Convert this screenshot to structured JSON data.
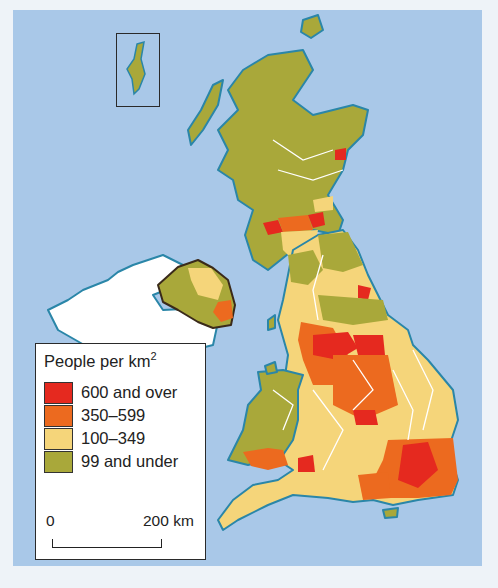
{
  "map": {
    "title": "Population density of the UK",
    "background_sea_color": "#a9c8e8",
    "inset_label": "Shetland Islands inset"
  },
  "legend": {
    "title": "People per km",
    "title_superscript": "2",
    "items": [
      {
        "label": "600 and over",
        "color": "#e5291f"
      },
      {
        "label": "350–599",
        "color": "#ec6a1f"
      },
      {
        "label": "100–349",
        "color": "#f5d57a"
      },
      {
        "label": "99 and under",
        "color": "#a9a83a"
      }
    ],
    "scale": {
      "zero": "0",
      "max": "200 km"
    }
  },
  "colors": {
    "coast": "#2a86a8",
    "boundary": "#ffffff",
    "ireland": "#ffffff",
    "ni_border": "#3a2a1a"
  }
}
